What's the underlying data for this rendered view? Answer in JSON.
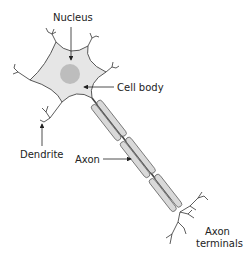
{
  "diagram": {
    "labels": {
      "nucleus": "Nucleus",
      "cell_body": "Cell body",
      "dendrite": "Dendrite",
      "axon": "Axon",
      "axon_terminals_line1": "Axon",
      "axon_terminals_line2": "terminals"
    },
    "colors": {
      "cell_fill": "#e6e6e6",
      "nucleus_fill": "#bdbdbd",
      "myelin_fill": "#d9d9d9",
      "outline": "#555555",
      "text": "#222222"
    }
  }
}
